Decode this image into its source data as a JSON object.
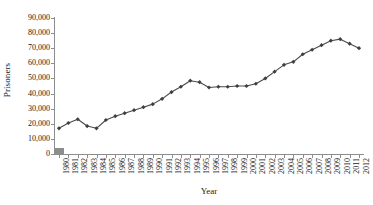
{
  "chart_data": {
    "type": "line",
    "title": "",
    "xlabel": "Year",
    "ylabel": "Prisoners",
    "xlim": [
      1980,
      2012
    ],
    "ylim": [
      0,
      90000
    ],
    "grid": false,
    "legend": null,
    "marker": "diamond",
    "line_color": "#4a4a4a",
    "marker_color": "#3f3f3f",
    "axis_color": "#8d8d8d",
    "y_ticks": [
      0,
      10000,
      20000,
      30000,
      40000,
      50000,
      60000,
      70000,
      80000,
      90000
    ],
    "y_tick_labels": [
      "0",
      "10,000",
      "20,000",
      "30,000",
      "40,000",
      "50,000",
      "60,000",
      "70,000",
      "80,000",
      "90,000"
    ],
    "categories": [
      "1980",
      "1981",
      "1982",
      "1983",
      "1984",
      "1985",
      "1986",
      "1987",
      "1988",
      "1989",
      "1990",
      "1991",
      "1992",
      "1993",
      "1994",
      "1995",
      "1996",
      "1997",
      "1998",
      "1999",
      "2000",
      "2001",
      "2002",
      "2003",
      "2004",
      "2005",
      "2006",
      "2007",
      "2008",
      "2009",
      "2010",
      "2011",
      "2012"
    ],
    "values": [
      17000,
      20500,
      23000,
      18500,
      17000,
      22500,
      25000,
      27000,
      29000,
      31000,
      33000,
      36500,
      41000,
      44500,
      48500,
      47500,
      44000,
      44500,
      44500,
      45000,
      45000,
      46500,
      50000,
      54500,
      59000,
      61000,
      66000,
      69000,
      72000,
      75000,
      76000,
      73000,
      70000
    ]
  }
}
